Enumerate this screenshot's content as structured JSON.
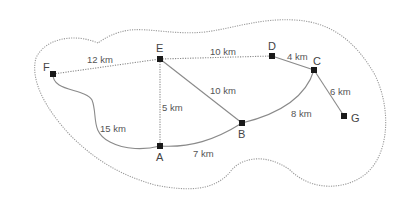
{
  "diagram": {
    "type": "weighted-graph-map",
    "nodes": [
      {
        "id": "A",
        "label": "A",
        "x": 160,
        "y": 146
      },
      {
        "id": "B",
        "label": "B",
        "x": 242,
        "y": 123
      },
      {
        "id": "C",
        "label": "C",
        "x": 314,
        "y": 70
      },
      {
        "id": "D",
        "label": "D",
        "x": 272,
        "y": 56
      },
      {
        "id": "E",
        "label": "E",
        "x": 160,
        "y": 59
      },
      {
        "id": "F",
        "label": "F",
        "x": 53,
        "y": 74
      },
      {
        "id": "G",
        "label": "G",
        "x": 344,
        "y": 116
      }
    ],
    "edges": [
      {
        "from": "F",
        "to": "E",
        "label": "12 km"
      },
      {
        "from": "E",
        "to": "D",
        "label": "10 km"
      },
      {
        "from": "D",
        "to": "C",
        "label": "4 km"
      },
      {
        "from": "C",
        "to": "G",
        "label": "6 km"
      },
      {
        "from": "E",
        "to": "B",
        "label": "10 km"
      },
      {
        "from": "E",
        "to": "A",
        "label": "5 km"
      },
      {
        "from": "F",
        "to": "A",
        "label": "15 km"
      },
      {
        "from": "A",
        "to": "B",
        "label": "7 km"
      },
      {
        "from": "B",
        "to": "C",
        "label": "8 km"
      }
    ]
  },
  "labels": {
    "nA": "A",
    "nB": "B",
    "nC": "C",
    "nD": "D",
    "nE": "E",
    "nF": "F",
    "nG": "G",
    "eFE": "12 km",
    "eED": "10 km",
    "eDC": "4 km",
    "eCG": "6 km",
    "eEB": "10 km",
    "eEA": "5 km",
    "eFA": "15 km",
    "eAB": "7 km",
    "eBC": "8 km"
  }
}
